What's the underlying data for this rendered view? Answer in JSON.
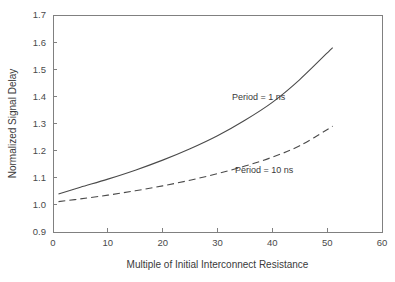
{
  "chart_data": {
    "type": "line",
    "title": "",
    "xlabel": "Multiple of Initial Interconnect Resistance",
    "ylabel": "Normalized Signal Delay",
    "xlim": [
      0,
      60
    ],
    "ylim": [
      0.9,
      1.7
    ],
    "xticks": [
      0,
      10,
      20,
      30,
      40,
      50,
      60
    ],
    "xtick_labels": [
      "0",
      "10",
      "20",
      "30",
      "40",
      "50",
      "60"
    ],
    "yticks": [
      0.9,
      1.0,
      1.1,
      1.2,
      1.3,
      1.4,
      1.5,
      1.6,
      1.7
    ],
    "ytick_labels": [
      "0.9",
      "1.0",
      "1.1",
      "1.2",
      "1.3",
      "1.4",
      "1.5",
      "1.6",
      "1.7"
    ],
    "grid": false,
    "legend_position": "inline-annotation",
    "series": [
      {
        "name": "Period = 1 ns",
        "style": "solid",
        "color": "#4a4a4a",
        "x": [
          1,
          5,
          10,
          15,
          20,
          25,
          30,
          35,
          40,
          45,
          51
        ],
        "values": [
          1.04,
          1.065,
          1.095,
          1.128,
          1.165,
          1.207,
          1.255,
          1.312,
          1.378,
          1.462,
          1.58
        ]
      },
      {
        "name": "Period = 10 ns",
        "style": "dashed",
        "color": "#4a4a4a",
        "x": [
          1,
          5,
          10,
          15,
          20,
          25,
          30,
          35,
          40,
          45,
          51
        ],
        "values": [
          1.012,
          1.022,
          1.036,
          1.052,
          1.07,
          1.091,
          1.115,
          1.143,
          1.176,
          1.218,
          1.29
        ]
      }
    ],
    "annotations": [
      {
        "text": "Period = 1 ns",
        "x": 37.5,
        "y": 1.385
      },
      {
        "text": "Period = 10 ns",
        "x": 38.5,
        "y": 1.117
      }
    ]
  }
}
